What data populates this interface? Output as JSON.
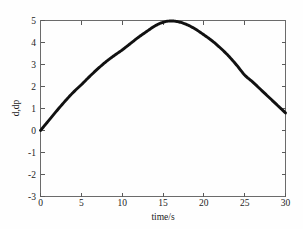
{
  "figure": {
    "background_color": "#fefefe",
    "frame_color": "#6b6b6b",
    "curve_color": "#111111"
  },
  "chart_data": {
    "type": "line",
    "title": "",
    "xlabel": "time/s",
    "ylabel": "d,dp",
    "xlim": [
      0,
      30
    ],
    "ylim": [
      -3,
      5
    ],
    "xticks": [
      0,
      5,
      10,
      15,
      20,
      25,
      30
    ],
    "yticks": [
      -3,
      -2,
      -1,
      0,
      1,
      2,
      3,
      4,
      5
    ],
    "xtick_labels": [
      "0",
      "5",
      "10",
      "15",
      "20",
      "25",
      "30"
    ],
    "ytick_labels": [
      "-3",
      "-2",
      "-1",
      "0",
      "1",
      "2",
      "3",
      "4",
      "5"
    ],
    "grid": false,
    "legend": null,
    "series": [
      {
        "name": "d,dp",
        "color": "#111111",
        "line_width": 2.9,
        "x": [
          0,
          1,
          2,
          3,
          4,
          5,
          6,
          7,
          8,
          9,
          10,
          11,
          12,
          13,
          14,
          15,
          16,
          17,
          18,
          19,
          20,
          21,
          22,
          23,
          24,
          25,
          26,
          27,
          28,
          29,
          30
        ],
        "y": [
          0.0,
          0.45,
          0.9,
          1.33,
          1.73,
          2.08,
          2.45,
          2.8,
          3.12,
          3.4,
          3.66,
          3.95,
          4.24,
          4.5,
          4.75,
          4.92,
          4.98,
          4.93,
          4.8,
          4.6,
          4.35,
          4.08,
          3.76,
          3.4,
          2.98,
          2.52,
          2.2,
          1.85,
          1.5,
          1.15,
          0.8
        ]
      }
    ],
    "annotations": []
  },
  "labels": {
    "x_axis_title": "time/s",
    "y_axis_title": "d,dp"
  }
}
